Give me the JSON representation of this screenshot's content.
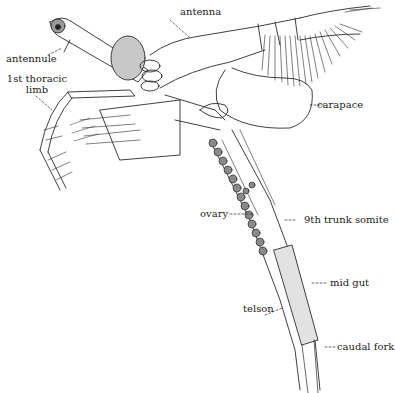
{
  "figure": {
    "type": "anatomical line drawing",
    "ink_color": "#2a2a2a",
    "background": "#ffffff"
  },
  "labels": {
    "antenna": "antenna",
    "antennule": "antennule",
    "thoracic_limb_line1": "1st thoracic",
    "thoracic_limb_line2": "limb",
    "carapace": "carapace",
    "ovary": "ovary",
    "trunk_somite": "9th trunk somite",
    "mid_gut": "mid gut",
    "telson": "telson",
    "caudal_fork": "caudal fork"
  }
}
